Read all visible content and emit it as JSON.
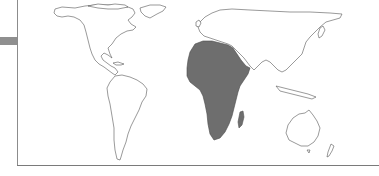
{
  "map": {
    "type": "world-choropleth",
    "highlighted_region": "Africa",
    "colors": {
      "highlight_fill": "#6e6e6e",
      "land_fill": "#ffffff",
      "outline": "#555555",
      "frame": "#8c8c8c",
      "side_bar": "#8f8f8f"
    },
    "regions": [
      {
        "name": "North America",
        "highlighted": false
      },
      {
        "name": "South America",
        "highlighted": false
      },
      {
        "name": "Europe",
        "highlighted": false
      },
      {
        "name": "Asia",
        "highlighted": false
      },
      {
        "name": "Africa",
        "highlighted": true
      },
      {
        "name": "Madagascar",
        "highlighted": false
      },
      {
        "name": "Australia",
        "highlighted": false
      },
      {
        "name": "New Zealand",
        "highlighted": false
      },
      {
        "name": "Greenland",
        "highlighted": false
      }
    ]
  }
}
